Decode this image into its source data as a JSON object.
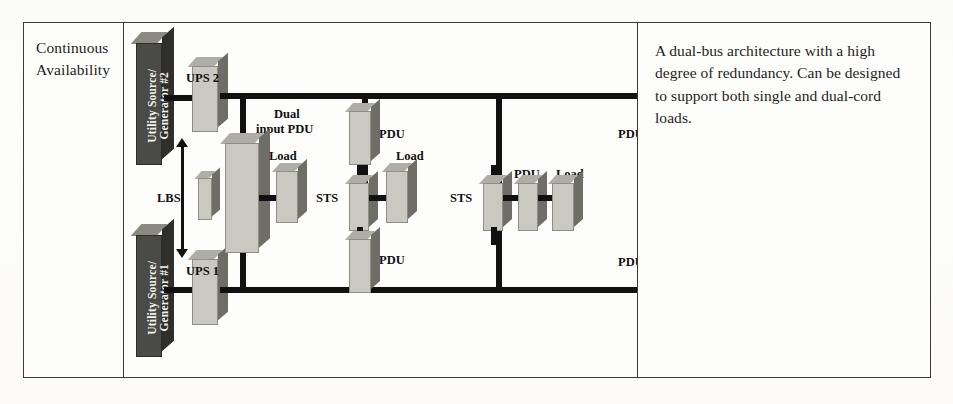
{
  "row": {
    "label": [
      "Continuous",
      "Availability"
    ],
    "description": "A dual-bus architecture with a high degree of redundancy. Can be designed to support both single and dual-cord loads."
  },
  "diagram": {
    "name": "dual-bus-power-architecture",
    "colors": {
      "bus": "#111111",
      "box_front": "#c9c9c2",
      "box_side": "#6e6e67",
      "slab_front": "#4a4a46",
      "slab_side": "#2e2e2b",
      "border": "#3a3a3a",
      "page": "#fdfdfb"
    },
    "sources": [
      {
        "id": "utility-2",
        "lines": [
          "Utility Source/",
          "Generator #2"
        ]
      },
      {
        "id": "utility-1",
        "lines": [
          "Utility Source/",
          "Generator #1"
        ]
      }
    ],
    "ups": [
      {
        "id": "ups-2",
        "label": "UPS 2"
      },
      {
        "id": "ups-1",
        "label": "UPS 1"
      }
    ],
    "lbs": {
      "label": "LBS"
    },
    "dual_input_pdu": {
      "lines": [
        "Dual",
        "input PDU"
      ]
    },
    "dual_input_load": {
      "lines": [
        "Dual input",
        "load"
      ]
    },
    "labels": {
      "pdu": "PDU",
      "load": "Load",
      "sts": "STS"
    },
    "components": [
      {
        "type": "pdu",
        "label": "PDU",
        "position": "top-left-branch"
      },
      {
        "type": "pdu",
        "label": "PDU",
        "position": "bottom-left-branch"
      },
      {
        "type": "pdu",
        "label": "PDU",
        "position": "top-mid-branch"
      },
      {
        "type": "pdu",
        "label": "PDU",
        "position": "bottom-mid-branch"
      },
      {
        "type": "pdu",
        "label": "PDU",
        "position": "top-right-branch"
      },
      {
        "type": "pdu",
        "label": "PDU",
        "position": "bottom-right-branch"
      },
      {
        "type": "load",
        "label": "Load",
        "position": "left"
      },
      {
        "type": "load",
        "label": "Load",
        "position": "center-left"
      },
      {
        "type": "load",
        "label": "Load",
        "position": "center-right"
      },
      {
        "type": "sts",
        "label": "STS",
        "position": "left-sts"
      },
      {
        "type": "sts",
        "label": "STS",
        "position": "right-sts"
      }
    ]
  }
}
